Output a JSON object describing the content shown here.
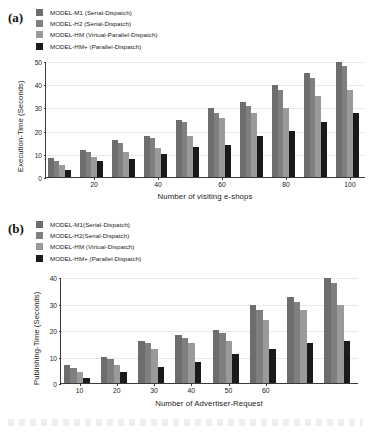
{
  "figure": {
    "background": "#ffffff",
    "series_colors": [
      "#6d6d6d",
      "#7f7f7f",
      "#9a9a9a",
      "#1a1a1a"
    ]
  },
  "panel_a": {
    "tag": "(a)",
    "legend": [
      {
        "label": "MODEL-M1 (Serial-Dispatch)",
        "color": "#6d6d6d"
      },
      {
        "label": "MODEL-H2 (Serial-Dispatch)",
        "color": "#7f7f7f"
      },
      {
        "label": "MODEL-HM (Virtual-Parallel-Dispatch)",
        "color": "#9a9a9a"
      },
      {
        "label": "MODEL-HM+ (Parallel-Dispatch)",
        "color": "#1a1a1a"
      }
    ],
    "chart_data": {
      "type": "bar",
      "title": "",
      "xlabel": "Number of visiting e-shops",
      "ylabel": "Execution-Time (Seconds)",
      "categories": [
        "10",
        "20",
        "30",
        "40",
        "50",
        "60",
        "70",
        "80",
        "90",
        "100"
      ],
      "xtick_labels": [
        "20",
        "40",
        "60",
        "80",
        "100"
      ],
      "xtick_categories": [
        "20",
        "40",
        "60",
        "80",
        "100"
      ],
      "ylim": [
        0,
        50
      ],
      "yticks": [
        0,
        10,
        20,
        30,
        40,
        50
      ],
      "grid": true,
      "legend_position": "above-plot",
      "series": [
        {
          "name": "MODEL-M1 (Serial-Dispatch)",
          "color": "#6d6d6d",
          "values": [
            8,
            11.8,
            15.8,
            17.5,
            24.5,
            29.6,
            32.5,
            39.7,
            44.7,
            49.7
          ]
        },
        {
          "name": "MODEL-H2 (Serial-Dispatch)",
          "color": "#7f7f7f",
          "values": [
            6.8,
            10.8,
            14.7,
            16.7,
            23.7,
            27.6,
            30.8,
            37.7,
            42.7,
            47.8
          ]
        },
        {
          "name": "MODEL-HM (Virtual-Parallel-Dispatch)",
          "color": "#9a9a9a",
          "values": [
            5,
            8.8,
            10.8,
            12.6,
            17.8,
            25.5,
            27.7,
            29.7,
            34.8,
            37.7
          ]
        },
        {
          "name": "MODEL-HM+ (Parallel-Dispatch)",
          "color": "#1a1a1a",
          "values": [
            2.9,
            6.9,
            7.8,
            9.8,
            12.8,
            13.8,
            17.8,
            19.8,
            23.8,
            27.7
          ]
        }
      ]
    }
  },
  "panel_b": {
    "tag": "(b)",
    "legend": [
      {
        "label": "MODEL-M1(Serial-Dispatch)",
        "color": "#6d6d6d"
      },
      {
        "label": "MODEL-H2(Serial-Dispatch)",
        "color": "#7f7f7f"
      },
      {
        "label": "MODEL-HM (Virtual-Dispatch)",
        "color": "#9a9a9a"
      },
      {
        "label": "MODEL-HM+ (Parallel-Dispatch)",
        "color": "#1a1a1a"
      }
    ],
    "chart_data": {
      "type": "bar",
      "title": "",
      "xlabel": "Number of Advertiser-Request",
      "ylabel": "Publishing-Time (Seconds)",
      "categories": [
        "10",
        "20",
        "30",
        "40",
        "50",
        "60",
        "70"
      ],
      "xtick_labels": [
        "10",
        "20",
        "30",
        "40",
        "50",
        "60"
      ],
      "xtick_categories": [
        "10",
        "20",
        "30",
        "40",
        "50",
        "60"
      ],
      "ylim": [
        0,
        40
      ],
      "yticks": [
        0,
        10,
        20,
        30,
        40
      ],
      "grid": true,
      "legend_position": "above-plot",
      "series": [
        {
          "name": "MODEL-M1(Serial-Dispatch)",
          "color": "#6d6d6d",
          "values": [
            6.8,
            10,
            15.8,
            18,
            20,
            29.6,
            32.6,
            39.8
          ]
        },
        {
          "name": "MODEL-H2(Serial-Dispatch)",
          "color": "#7f7f7f",
          "values": [
            5.8,
            9,
            15,
            17,
            19,
            27.7,
            30.6,
            37.9
          ]
        },
        {
          "name": "MODEL-HM (Virtual-Dispatch)",
          "color": "#9a9a9a",
          "values": [
            4,
            6.8,
            12.8,
            15,
            16,
            23.8,
            27.6,
            29.6
          ]
        },
        {
          "name": "MODEL-HM+ (Parallel-Dispatch)",
          "color": "#1a1a1a",
          "values": [
            2,
            4,
            6,
            8,
            11,
            13,
            15,
            16
          ]
        }
      ]
    }
  }
}
